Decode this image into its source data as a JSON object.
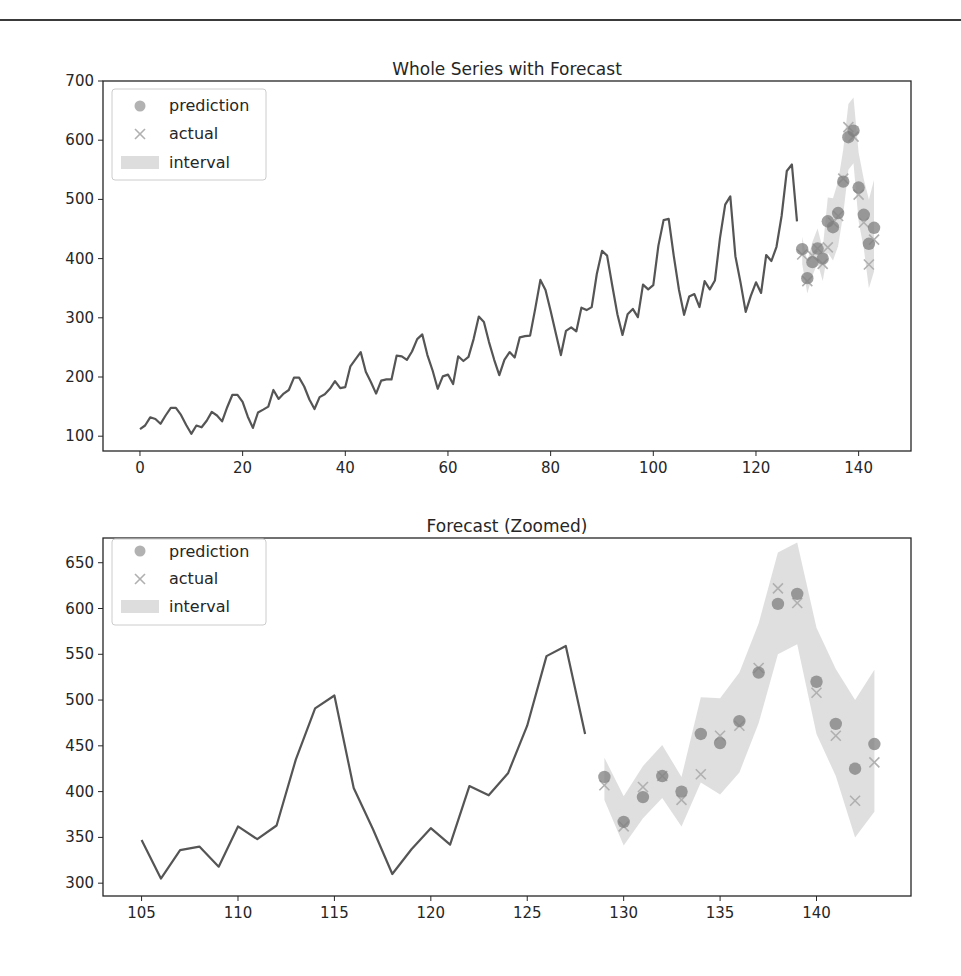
{
  "chart_data": [
    {
      "type": "line",
      "title": "Whole Series with Forecast",
      "xlabel": "",
      "ylabel": "",
      "xlim": [
        -7.2,
        150.2
      ],
      "ylim": [
        75,
        700
      ],
      "xticks": [
        0,
        20,
        40,
        60,
        80,
        100,
        120,
        140
      ],
      "yticks": [
        100,
        200,
        300,
        400,
        500,
        600,
        700
      ],
      "grid": false,
      "legend_position": "upper left",
      "legend": [
        "prediction",
        "actual",
        "interval"
      ],
      "series": [
        {
          "name": "train",
          "kind": "line",
          "x_start": 0,
          "values": [
            112,
            118,
            132,
            129,
            121,
            135,
            148,
            148,
            136,
            119,
            104,
            118,
            115,
            126,
            141,
            135,
            125,
            149,
            170,
            170,
            158,
            133,
            114,
            140,
            145,
            150,
            178,
            163,
            172,
            178,
            199,
            199,
            184,
            162,
            146,
            166,
            171,
            180,
            193,
            181,
            183,
            218,
            230,
            242,
            209,
            191,
            172,
            194,
            196,
            196,
            236,
            235,
            229,
            243,
            264,
            272,
            237,
            211,
            180,
            201,
            204,
            188,
            235,
            227,
            234,
            264,
            302,
            293,
            259,
            229,
            203,
            229,
            242,
            233,
            267,
            269,
            270,
            315,
            364,
            347,
            312,
            274,
            237,
            278,
            284,
            277,
            317,
            313,
            318,
            374,
            413,
            405,
            355,
            306,
            271,
            306,
            315,
            301,
            356,
            348,
            355,
            422,
            465,
            467,
            404,
            347,
            305,
            336,
            340,
            318,
            362,
            348,
            363,
            435,
            491,
            505,
            404,
            359,
            310,
            337,
            360,
            342,
            406,
            396,
            420,
            472,
            548,
            559,
            463
          ]
        },
        {
          "name": "prediction",
          "kind": "scatter-circle",
          "x": [
            129,
            130,
            131,
            132,
            133,
            134,
            135,
            136,
            137,
            138,
            139,
            140,
            141,
            142,
            143
          ],
          "values": [
            416,
            367,
            394,
            417,
            400,
            463,
            453,
            477,
            530,
            605,
            616,
            520,
            474,
            425,
            452
          ]
        },
        {
          "name": "actual",
          "kind": "scatter-x",
          "x": [
            129,
            130,
            131,
            132,
            133,
            134,
            135,
            136,
            137,
            138,
            139,
            140,
            141,
            142,
            143
          ],
          "values": [
            407,
            362,
            405,
            417,
            391,
            419,
            461,
            472,
            535,
            622,
            606,
            508,
            461,
            390,
            432
          ]
        },
        {
          "name": "interval",
          "kind": "band",
          "x": [
            129,
            130,
            131,
            132,
            133,
            134,
            135,
            136,
            137,
            138,
            139,
            140,
            141,
            142,
            143
          ],
          "lower": [
            391,
            341,
            371,
            393,
            362,
            410,
            397,
            421,
            475,
            550,
            561,
            463,
            417,
            350,
            378
          ],
          "upper": [
            437,
            395,
            428,
            451,
            416,
            503,
            502,
            530,
            584,
            661,
            672,
            579,
            534,
            500,
            533
          ]
        }
      ]
    },
    {
      "type": "line",
      "title": "Forecast (Zoomed)",
      "xlabel": "",
      "ylabel": "",
      "xlim": [
        103.0,
        144.9
      ],
      "ylim": [
        286,
        677
      ],
      "xticks": [
        105,
        110,
        115,
        120,
        125,
        130,
        135,
        140
      ],
      "yticks": [
        300,
        350,
        400,
        450,
        500,
        550,
        600,
        650
      ],
      "grid": false,
      "legend_position": "upper left",
      "legend": [
        "prediction",
        "actual",
        "interval"
      ],
      "series": [
        {
          "name": "train",
          "kind": "line",
          "x_start": 105,
          "values": [
            347,
            305,
            336,
            340,
            318,
            362,
            348,
            363,
            435,
            491,
            505,
            404,
            359,
            310,
            337,
            360,
            342,
            406,
            396,
            420,
            472,
            548,
            559,
            463
          ]
        },
        {
          "name": "prediction",
          "kind": "scatter-circle",
          "x": [
            129,
            130,
            131,
            132,
            133,
            134,
            135,
            136,
            137,
            138,
            139,
            140,
            141,
            142,
            143
          ],
          "values": [
            416,
            367,
            394,
            417,
            400,
            463,
            453,
            477,
            530,
            605,
            616,
            520,
            474,
            425,
            452
          ]
        },
        {
          "name": "actual",
          "kind": "scatter-x",
          "x": [
            129,
            130,
            131,
            132,
            133,
            134,
            135,
            136,
            137,
            138,
            139,
            140,
            141,
            142,
            143
          ],
          "values": [
            407,
            362,
            405,
            417,
            391,
            419,
            461,
            472,
            535,
            622,
            606,
            508,
            461,
            390,
            432
          ]
        },
        {
          "name": "interval",
          "kind": "band",
          "x": [
            129,
            130,
            131,
            132,
            133,
            134,
            135,
            136,
            137,
            138,
            139,
            140,
            141,
            142,
            143
          ],
          "lower": [
            391,
            341,
            371,
            393,
            362,
            410,
            397,
            421,
            475,
            550,
            561,
            463,
            417,
            350,
            378
          ],
          "upper": [
            437,
            395,
            428,
            451,
            416,
            503,
            502,
            530,
            584,
            661,
            672,
            579,
            534,
            500,
            533
          ]
        }
      ]
    }
  ],
  "colors": {
    "line": "#555555",
    "prediction": "#7f7f7f",
    "actual": "#b0b0b0",
    "interval": "#d9d9d9",
    "axis": "#262626",
    "legend_border": "#cccccc"
  },
  "legend_labels": {
    "prediction": "prediction",
    "actual": "actual",
    "interval": "interval"
  },
  "titles": {
    "top": "Whole Series with Forecast",
    "bottom": "Forecast (Zoomed)"
  }
}
